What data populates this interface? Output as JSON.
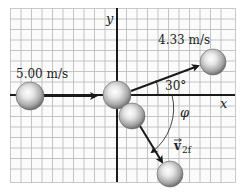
{
  "diagram": {
    "type": "two-dimensional elastic collision",
    "axes": {
      "x_label": "x",
      "y_label": "y"
    },
    "labels": {
      "incoming_speed": "5.00 m/s",
      "outgoing_speed_1": "4.33 m/s",
      "angle_1": "30°",
      "angle_2": "φ",
      "velocity_2f": "v⃗2f",
      "velocity_2f_base": "v",
      "velocity_2f_sub": "2f"
    },
    "balls": [
      {
        "name": "incoming-ball",
        "cx": 30,
        "cy": 96
      },
      {
        "name": "collision-ball-1",
        "cx": 117,
        "cy": 95
      },
      {
        "name": "collision-ball-2",
        "cx": 132,
        "cy": 116
      },
      {
        "name": "outgoing-ball-1",
        "cx": 213,
        "cy": 62
      },
      {
        "name": "outgoing-ball-2",
        "cx": 170,
        "cy": 174
      }
    ],
    "colors": {
      "grid": "#b8b8b8",
      "axis": "#1a1a1a",
      "ball_light": "#f4f4f4",
      "ball_mid": "#bdbdbd",
      "ball_dark": "#6e6e6e"
    }
  }
}
